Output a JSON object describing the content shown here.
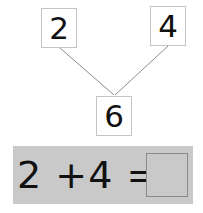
{
  "number_bond": {
    "part_a": "2",
    "part_b": "4",
    "whole": "6"
  },
  "equation": {
    "left_operand": "2",
    "operator": "+",
    "right_operand": "4",
    "equals": "=",
    "answer": ""
  },
  "colors": {
    "band": "#c9c9c9",
    "box_border": "#c4c4c4",
    "line": "#8c8c8c",
    "text": "#111111"
  }
}
